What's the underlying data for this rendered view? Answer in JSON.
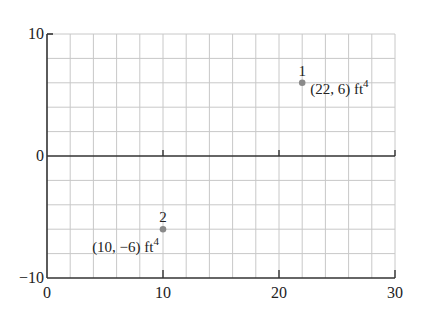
{
  "chart_data": {
    "type": "scatter",
    "title": "",
    "xlabel": "",
    "ylabel": "",
    "xlim": [
      0,
      30
    ],
    "ylim": [
      -10,
      10
    ],
    "grid": true,
    "x_grid_step": 2,
    "y_grid_step": 2,
    "x_ticks": [
      0,
      10,
      20,
      30
    ],
    "y_ticks": [
      -10,
      0,
      10
    ],
    "x_tick_labels": [
      "0",
      "10",
      "20",
      "30"
    ],
    "y_tick_labels": [
      "−10",
      "0",
      "10"
    ],
    "series": [
      {
        "name": "points",
        "points": [
          {
            "id": "1",
            "x": 22,
            "y": 6,
            "label": "(22, 6) ft",
            "unit_sup": "4"
          },
          {
            "id": "2",
            "x": 10,
            "y": -6,
            "label": "(10, −6) ft",
            "unit_sup": "4"
          }
        ]
      }
    ],
    "colors": {
      "axis": "#333333",
      "grid": "#c8c8c8",
      "point": "#8a8a8a",
      "text": "#222222"
    }
  }
}
